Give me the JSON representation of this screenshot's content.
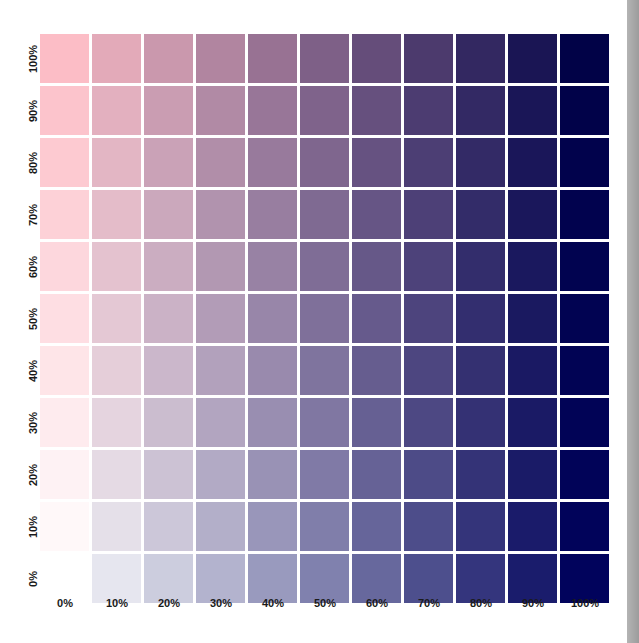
{
  "chart_data": {
    "type": "heatmap",
    "title": "",
    "xlabel": "",
    "ylabel": "",
    "x_tick_labels": [
      "0%",
      "10%",
      "20%",
      "30%",
      "40%",
      "50%",
      "60%",
      "70%",
      "80%",
      "90%",
      "100%"
    ],
    "y_tick_labels": [
      "100%",
      "90%",
      "80%",
      "70%",
      "60%",
      "50%",
      "40%",
      "30%",
      "20%",
      "10%",
      "0%"
    ],
    "x": [
      0,
      10,
      20,
      30,
      40,
      50,
      60,
      70,
      80,
      90,
      100
    ],
    "y": [
      100,
      90,
      80,
      70,
      60,
      50,
      40,
      30,
      20,
      10,
      0
    ],
    "x_color": "#01035c",
    "y_color": "#fcbdc6",
    "grid": false,
    "legend": "none"
  },
  "layout": {
    "origin_x": 40,
    "origin_y": 34,
    "pitch": 52,
    "cell": 49
  }
}
